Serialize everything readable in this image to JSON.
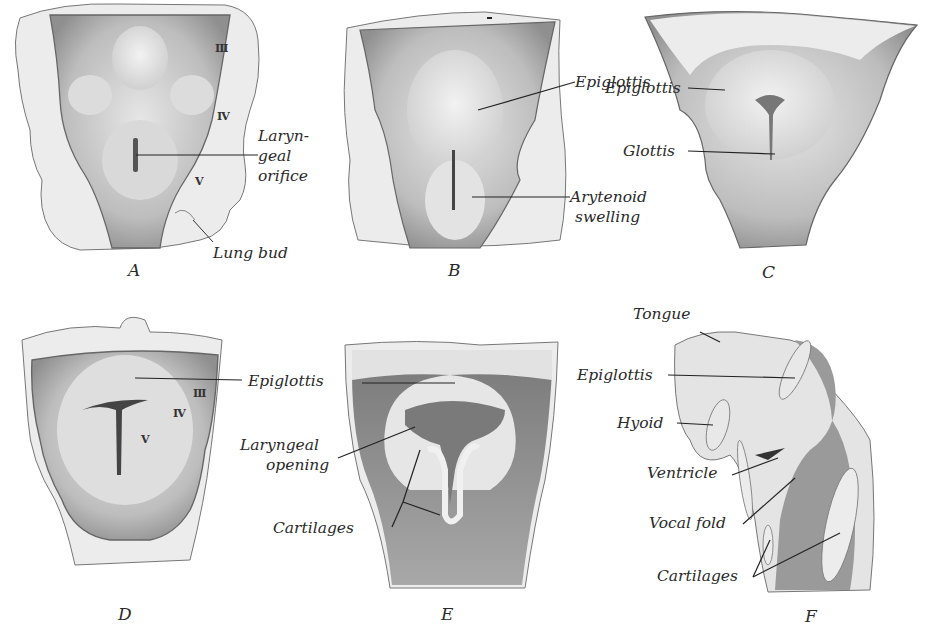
{
  "figure": {
    "panels": [
      {
        "id": "A",
        "caption": "A",
        "labels": {
          "larynx_l1": "Laryn-",
          "larynx_l2": "geal",
          "larynx_l3": "orifice",
          "lung_bud": "Lung bud"
        },
        "arches": [
          "III",
          "IV",
          "V"
        ]
      },
      {
        "id": "B",
        "caption": "B",
        "labels": {
          "epiglottis": "Epiglottis",
          "arytenoid_l1": "Arytenoid",
          "arytenoid_l2": "swelling"
        }
      },
      {
        "id": "C",
        "caption": "C",
        "labels": {
          "epiglottis": "Epiglottis",
          "glottis": "Glottis"
        }
      },
      {
        "id": "D",
        "caption": "D",
        "arches": [
          "III",
          "IV",
          "V"
        ]
      },
      {
        "id": "E",
        "caption": "E",
        "labels": {
          "epiglottis": "Epiglottis",
          "laryngeal_l1": "Laryngeal",
          "laryngeal_l2": "opening",
          "cartilages": "Cartilages"
        }
      },
      {
        "id": "F",
        "caption": "F",
        "labels": {
          "tongue": "Tongue",
          "epiglottis": "Epiglottis",
          "hyoid": "Hyoid",
          "ventricle": "Ventricle",
          "vocal_fold": "Vocal fold",
          "cartilages": "Cartilages"
        }
      }
    ],
    "colors": {
      "tissue_light": "#ececec",
      "tissue_mid": "#c9c9c9",
      "tissue_dark": "#8a8a8a",
      "edge": "#555555",
      "leader": "#222222"
    }
  }
}
